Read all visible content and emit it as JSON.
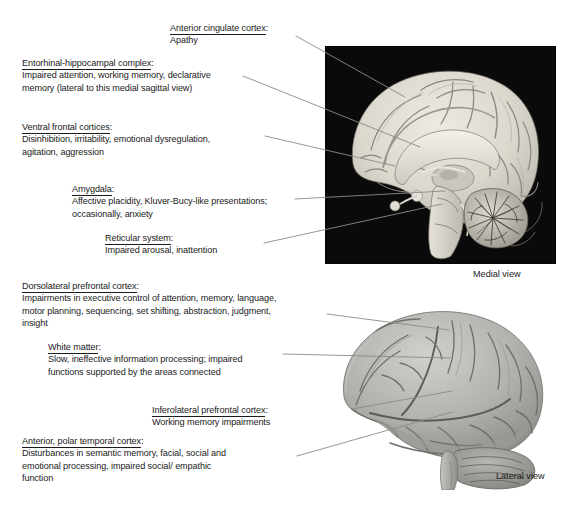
{
  "figure": {
    "background_color": "#ffffff",
    "text_color": "#1a1a1a",
    "leader_line_color": "#8a8a8a"
  },
  "annotations": [
    {
      "id": "anterior-cingulate-cortex",
      "heading": "Anterior cingulate cortex",
      "colon": ":",
      "body_lines": [
        "Apathy"
      ]
    },
    {
      "id": "entorhinal-hippocampal-complex",
      "heading": "Entorhinal-hippocampal complex",
      "colon": ":",
      "body_lines": [
        "Impaired attention, working memory, declarative",
        "memory (lateral to this medial sagittal view)"
      ]
    },
    {
      "id": "ventral-frontal-cortices",
      "heading": "Ventral frontal cortices",
      "colon": ":",
      "body_lines": [
        "Disinhibition, irritability, emotional dysregulation,",
        "agitation, aggression"
      ]
    },
    {
      "id": "amygdala",
      "heading": "Amygdala",
      "colon": ":",
      "body_lines": [
        "Affective placidity, Kluver-Bucy-like presentations;",
        "occasionally, anxiety"
      ]
    },
    {
      "id": "reticular-system",
      "heading": "Reticular system",
      "colon": ":",
      "body_lines": [
        "Impaired arousal, inattention"
      ]
    },
    {
      "id": "dorsolateral-prefrontal-cortex",
      "heading": "Dorsolateral prefrontal cortex",
      "colon": ":",
      "body_lines": [
        "Impairments in executive control of attention, memory, language,",
        "motor planning, sequencing, set shifting, abstraction, judgment,",
        "insight"
      ]
    },
    {
      "id": "white-matter",
      "heading": "White matter",
      "colon": ":",
      "body_lines": [
        "Slow, ineffective information processing; impaired",
        "functions supported by the areas connected"
      ]
    },
    {
      "id": "inferolateral-prefrontal-cortex",
      "heading": "Inferolateral prefrontal cortex",
      "colon": ":",
      "body_lines": [
        "Working memory impairments"
      ]
    },
    {
      "id": "anterior-polar-temporal-cortex",
      "heading": "Anterior, polar temporal cortex",
      "colon": ":",
      "body_lines": [
        "Disturbances in semantic memory, facial, social and",
        "emotional processing, impaired social/ empathic",
        "function"
      ]
    }
  ],
  "captions": {
    "medial": "Medial view",
    "lateral": "Lateral view"
  },
  "images": {
    "medial": {
      "name": "medial-sagittal-brain-photograph",
      "background_color": "#0a0a0a",
      "tissue_color": "#d9d5cd"
    },
    "lateral": {
      "name": "lateral-brain-photograph",
      "background_color": "#ffffff",
      "tissue_color": "#a8a6a2"
    }
  }
}
